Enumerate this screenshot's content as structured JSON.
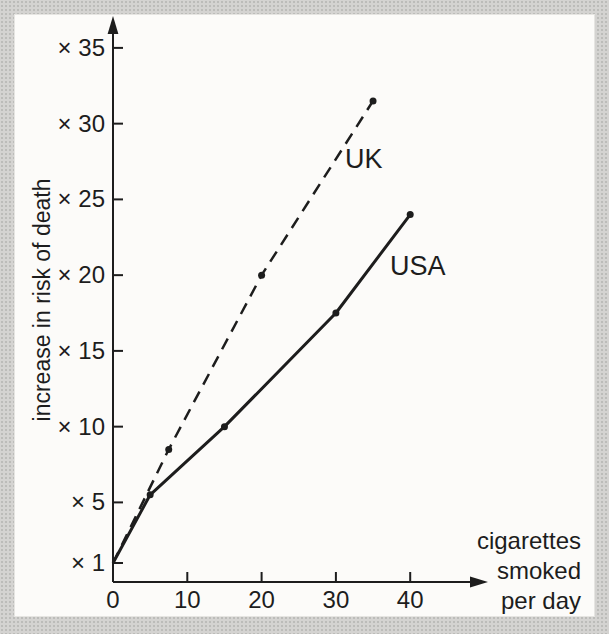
{
  "figure": {
    "background_color": "#d4d3d1",
    "panel_color": "#fcfbf9",
    "ink_color": "#1d1d1d"
  },
  "chart_data": {
    "type": "line",
    "title": "",
    "ylabel": "increase in risk of death",
    "xlabel": "cigarettes smoked per day",
    "xlabel_lines": [
      "cigarettes",
      "smoked",
      "per day"
    ],
    "xlim": [
      0,
      49
    ],
    "ylim": [
      1,
      37
    ],
    "grid": false,
    "legend_position": "inline-labels",
    "x_ticks": [
      {
        "value": 0,
        "label": "0"
      },
      {
        "value": 10,
        "label": "10"
      },
      {
        "value": 20,
        "label": "20"
      },
      {
        "value": 30,
        "label": "30"
      },
      {
        "value": 40,
        "label": "40"
      }
    ],
    "y_ticks": [
      {
        "value": 1,
        "label": "× 1"
      },
      {
        "value": 5,
        "label": "× 5"
      },
      {
        "value": 10,
        "label": "× 10"
      },
      {
        "value": 15,
        "label": "× 15"
      },
      {
        "value": 20,
        "label": "× 20"
      },
      {
        "value": 25,
        "label": "× 25"
      },
      {
        "value": 30,
        "label": "× 30"
      },
      {
        "value": 35,
        "label": "× 35"
      }
    ],
    "series": [
      {
        "name": "UK",
        "line_style": "dashed",
        "color": "#1d1d1d",
        "x": [
          0,
          7.5,
          20,
          35
        ],
        "y": [
          1,
          8.5,
          20,
          31.5
        ]
      },
      {
        "name": "USA",
        "line_style": "solid",
        "color": "#1d1d1d",
        "x": [
          0,
          5,
          15,
          30,
          40
        ],
        "y": [
          1,
          5.5,
          10,
          17.5,
          24
        ]
      }
    ]
  }
}
